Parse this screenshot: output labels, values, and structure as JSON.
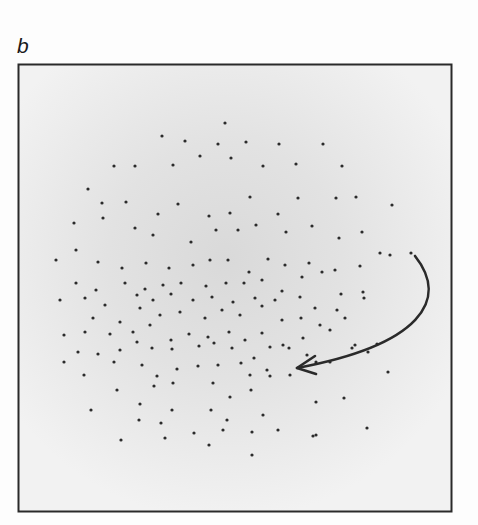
{
  "figure": {
    "panel_label": "b",
    "frame": {
      "x": 18,
      "y": 64,
      "width": 433,
      "height": 447,
      "stroke": "#2a2a2a"
    },
    "background": {
      "center_color": "#dcdcdc",
      "edge_color": "#f0f0f0",
      "center_x": 225,
      "center_y": 260
    },
    "dot_color": "#2b2b2b",
    "arrow": {
      "color": "#2a2a2a",
      "start": [
        415,
        256
      ],
      "control1": [
        450,
        300
      ],
      "control2": [
        420,
        345
      ],
      "end": [
        297,
        368
      ],
      "description": "curved arrow from right-edge dot sweeping down-left into the cloud"
    },
    "dots": [
      [
        225,
        123
      ],
      [
        162,
        136
      ],
      [
        185,
        141
      ],
      [
        218,
        144
      ],
      [
        246,
        142
      ],
      [
        279,
        144
      ],
      [
        323,
        144
      ],
      [
        114,
        166
      ],
      [
        135,
        166
      ],
      [
        173,
        165
      ],
      [
        200,
        156
      ],
      [
        231,
        158
      ],
      [
        263,
        166
      ],
      [
        296,
        164
      ],
      [
        342,
        166
      ],
      [
        88,
        189
      ],
      [
        102,
        203
      ],
      [
        126,
        202
      ],
      [
        158,
        214
      ],
      [
        178,
        204
      ],
      [
        209,
        216
      ],
      [
        230,
        213
      ],
      [
        250,
        197
      ],
      [
        278,
        214
      ],
      [
        298,
        198
      ],
      [
        336,
        198
      ],
      [
        356,
        197
      ],
      [
        392,
        205
      ],
      [
        74,
        223
      ],
      [
        103,
        218
      ],
      [
        135,
        228
      ],
      [
        153,
        235
      ],
      [
        191,
        242
      ],
      [
        216,
        230
      ],
      [
        238,
        230
      ],
      [
        256,
        225
      ],
      [
        286,
        232
      ],
      [
        312,
        226
      ],
      [
        339,
        238
      ],
      [
        362,
        232
      ],
      [
        380,
        253
      ],
      [
        56,
        260
      ],
      [
        76,
        250
      ],
      [
        98,
        262
      ],
      [
        122,
        268
      ],
      [
        146,
        263
      ],
      [
        169,
        268
      ],
      [
        193,
        265
      ],
      [
        210,
        260
      ],
      [
        228,
        260
      ],
      [
        249,
        272
      ],
      [
        268,
        259
      ],
      [
        285,
        265
      ],
      [
        309,
        263
      ],
      [
        335,
        270
      ],
      [
        360,
        266
      ],
      [
        390,
        255
      ],
      [
        411,
        253
      ],
      [
        76,
        283
      ],
      [
        96,
        290
      ],
      [
        125,
        283
      ],
      [
        145,
        289
      ],
      [
        163,
        285
      ],
      [
        181,
        283
      ],
      [
        206,
        286
      ],
      [
        226,
        283
      ],
      [
        244,
        283
      ],
      [
        262,
        280
      ],
      [
        282,
        291
      ],
      [
        302,
        277
      ],
      [
        322,
        272
      ],
      [
        341,
        294
      ],
      [
        363,
        292
      ],
      [
        60,
        300
      ],
      [
        85,
        298
      ],
      [
        105,
        305
      ],
      [
        137,
        295
      ],
      [
        153,
        300
      ],
      [
        171,
        294
      ],
      [
        193,
        300
      ],
      [
        212,
        297
      ],
      [
        233,
        302
      ],
      [
        255,
        298
      ],
      [
        275,
        300
      ],
      [
        300,
        297
      ],
      [
        315,
        308
      ],
      [
        345,
        318
      ],
      [
        364,
        298
      ],
      [
        93,
        318
      ],
      [
        120,
        322
      ],
      [
        140,
        308
      ],
      [
        160,
        315
      ],
      [
        180,
        312
      ],
      [
        205,
        318
      ],
      [
        222,
        310
      ],
      [
        240,
        315
      ],
      [
        262,
        306
      ],
      [
        282,
        320
      ],
      [
        301,
        318
      ],
      [
        320,
        325
      ],
      [
        337,
        310
      ],
      [
        355,
        345
      ],
      [
        64,
        335
      ],
      [
        85,
        332
      ],
      [
        110,
        334
      ],
      [
        133,
        332
      ],
      [
        150,
        325
      ],
      [
        171,
        340
      ],
      [
        189,
        334
      ],
      [
        208,
        337
      ],
      [
        229,
        332
      ],
      [
        245,
        340
      ],
      [
        262,
        333
      ],
      [
        283,
        345
      ],
      [
        303,
        338
      ],
      [
        330,
        330
      ],
      [
        352,
        348
      ],
      [
        78,
        352
      ],
      [
        98,
        354
      ],
      [
        120,
        350
      ],
      [
        137,
        342
      ],
      [
        152,
        348
      ],
      [
        172,
        349
      ],
      [
        199,
        346
      ],
      [
        214,
        343
      ],
      [
        232,
        348
      ],
      [
        254,
        358
      ],
      [
        270,
        347
      ],
      [
        289,
        348
      ],
      [
        307,
        355
      ],
      [
        316,
        362
      ],
      [
        368,
        352
      ],
      [
        377,
        344
      ],
      [
        64,
        362
      ],
      [
        84,
        375
      ],
      [
        114,
        362
      ],
      [
        142,
        365
      ],
      [
        157,
        376
      ],
      [
        177,
        369
      ],
      [
        198,
        366
      ],
      [
        218,
        365
      ],
      [
        241,
        363
      ],
      [
        250,
        375
      ],
      [
        267,
        370
      ],
      [
        290,
        375
      ],
      [
        330,
        362
      ],
      [
        388,
        372
      ],
      [
        117,
        390
      ],
      [
        154,
        386
      ],
      [
        173,
        383
      ],
      [
        213,
        383
      ],
      [
        230,
        397
      ],
      [
        251,
        390
      ],
      [
        270,
        376
      ],
      [
        91,
        410
      ],
      [
        140,
        404
      ],
      [
        172,
        410
      ],
      [
        211,
        410
      ],
      [
        227,
        420
      ],
      [
        263,
        415
      ],
      [
        316,
        402
      ],
      [
        344,
        398
      ],
      [
        139,
        420
      ],
      [
        161,
        423
      ],
      [
        194,
        433
      ],
      [
        223,
        430
      ],
      [
        252,
        432
      ],
      [
        278,
        430
      ],
      [
        316,
        435
      ],
      [
        367,
        428
      ],
      [
        121,
        440
      ],
      [
        165,
        438
      ],
      [
        209,
        445
      ],
      [
        252,
        455
      ],
      [
        313,
        436
      ]
    ]
  }
}
